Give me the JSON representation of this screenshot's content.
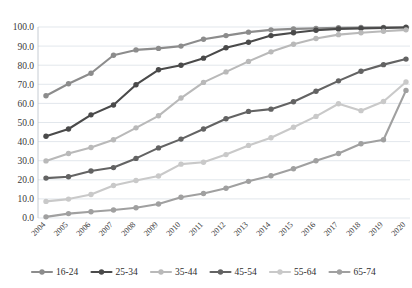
{
  "chart_data": {
    "type": "line",
    "title": "",
    "subtitle": "",
    "xlabel": "",
    "ylabel": "",
    "ylim": [
      0,
      100
    ],
    "ytick_step": 10,
    "grid": true,
    "legend_position": "bottom",
    "x": [
      "2004",
      "2005",
      "2006",
      "2007",
      "2008",
      "2009",
      "2010",
      "2011",
      "2012",
      "2013",
      "2014",
      "2015",
      "2016",
      "2017",
      "2018",
      "2019",
      "2020"
    ],
    "categories": [
      "2004",
      "2005",
      "2006",
      "2007",
      "2008",
      "2009",
      "2010",
      "2011",
      "2012",
      "2013",
      "2014",
      "2015",
      "2016",
      "2017",
      "2018",
      "2019",
      "2020"
    ],
    "yticks": [
      "0.0",
      "10.0",
      "20.0",
      "30.0",
      "40.0",
      "50.0",
      "60.0",
      "70.0",
      "80.0",
      "90.0",
      "100.0"
    ],
    "series": [
      {
        "name": "16-24",
        "color": "#8c8c8c",
        "values": [
          64.0,
          70.3,
          75.8,
          85.2,
          88.0,
          88.8,
          90.0,
          93.6,
          95.5,
          97.3,
          98.5,
          99.0,
          99.3,
          99.6,
          99.7,
          99.8,
          99.9
        ]
      },
      {
        "name": "25-34",
        "color": "#4a4a4a",
        "values": [
          42.8,
          46.6,
          54.0,
          59.2,
          69.8,
          77.6,
          80.0,
          83.7,
          89.1,
          92.0,
          95.5,
          97.0,
          98.3,
          99.0,
          99.3,
          99.5,
          99.7
        ]
      },
      {
        "name": "35-44",
        "color": "#b9b9b9",
        "values": [
          29.9,
          33.8,
          36.9,
          41.0,
          47.2,
          53.5,
          62.8,
          71.0,
          76.5,
          82.0,
          87.0,
          91.0,
          94.0,
          96.0,
          97.0,
          97.8,
          98.5
        ]
      },
      {
        "name": "45-54",
        "color": "#636363",
        "values": [
          20.9,
          21.6,
          24.6,
          26.4,
          31.2,
          36.7,
          41.3,
          46.6,
          52.0,
          55.8,
          57.0,
          60.9,
          66.4,
          71.8,
          76.8,
          80.3,
          83.2
        ]
      },
      {
        "name": "55-64",
        "color": "#c9c9c9",
        "values": [
          8.7,
          9.9,
          12.3,
          17.0,
          19.6,
          22.0,
          28.2,
          29.2,
          33.2,
          38.0,
          42.0,
          47.5,
          53.2,
          59.8,
          56.2,
          61.0,
          71.2
        ]
      },
      {
        "name": "65-74",
        "color": "#a0a0a0",
        "values": [
          0.6,
          2.3,
          3.3,
          4.2,
          5.4,
          7.3,
          10.9,
          12.8,
          15.6,
          19.2,
          22.1,
          25.8,
          30.0,
          33.8,
          38.9,
          41.0,
          66.8
        ]
      }
    ]
  },
  "legend": {
    "items": [
      {
        "label": "16-24",
        "color": "#8c8c8c"
      },
      {
        "label": "25-34",
        "color": "#4a4a4a"
      },
      {
        "label": "35-44",
        "color": "#b9b9b9"
      },
      {
        "label": "45-54",
        "color": "#636363"
      },
      {
        "label": "55-64",
        "color": "#c9c9c9"
      },
      {
        "label": "65-74",
        "color": "#a0a0a0"
      }
    ]
  }
}
